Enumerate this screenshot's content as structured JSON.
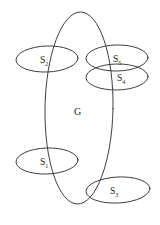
{
  "figure": {
    "name": "set-containment-venn-diagram",
    "background_color": "#ffffff",
    "stroke_color": "#2b2b2b",
    "text_color": "#1a1a1a",
    "width": 160,
    "height": 225
  },
  "labels": {
    "group": "G",
    "s1_base": "S",
    "s1_sub": "1",
    "s2_base": "S",
    "s2_sub": "2",
    "s3_base": "S",
    "s3_sub": "3",
    "s4_base": "S",
    "s4_sub": "4",
    "s5_base": "S",
    "s5_sub": "5"
  },
  "shapes": {
    "main_ellipse": {
      "label": "G",
      "cx": 79,
      "cy": 108,
      "rx": 34,
      "ry": 96
    },
    "subsets": [
      {
        "label": "S2",
        "position": "upper-left",
        "cx": 47,
        "cy": 59,
        "rx": 31,
        "ry": 13
      },
      {
        "label": "S5",
        "position": "upper-right",
        "cx": 117,
        "cy": 58,
        "rx": 31,
        "ry": 13
      },
      {
        "label": "S4",
        "position": "mid-right",
        "cx": 117,
        "cy": 77,
        "rx": 31,
        "ry": 13
      },
      {
        "label": "S1",
        "position": "lower-left",
        "cx": 47,
        "cy": 161,
        "rx": 31,
        "ry": 13
      },
      {
        "label": "S3",
        "position": "lower-right",
        "cx": 118,
        "cy": 190,
        "rx": 32,
        "ry": 13
      }
    ]
  }
}
